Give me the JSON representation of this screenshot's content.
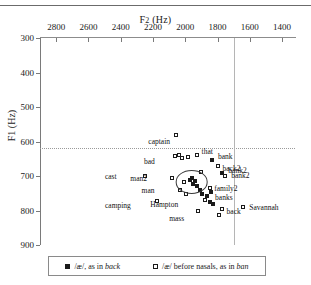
{
  "chart_data": {
    "type": "scatter",
    "title": "",
    "xlabel": "F2 (Hz)",
    "ylabel": "F1 (Hz)",
    "xlim": [
      2900,
      1320
    ],
    "ylim": [
      900,
      300
    ],
    "x_ticks": [
      2800,
      2600,
      2400,
      2200,
      2000,
      1800,
      1600,
      1400
    ],
    "y_ticks": [
      300,
      400,
      500,
      600,
      700,
      800,
      900
    ],
    "x_inverted": true,
    "y_inverted": true,
    "grid": false,
    "reference_lines": [
      {
        "orientation": "horizontal",
        "value": 620,
        "style": "dotted"
      },
      {
        "orientation": "vertical",
        "value": 1700,
        "style": "solid"
      }
    ],
    "annotations": [
      {
        "shape": "ellipse",
        "cx": 1960,
        "cy": 718,
        "rx": 95,
        "ry": 32
      }
    ],
    "series": [
      {
        "name": "/æ/, as in back",
        "marker": "filled-square",
        "points": [
          {
            "label": "bank",
            "x": 1835,
            "y": 654,
            "lx": 6,
            "ly": -4
          },
          {
            "label": "bank2",
            "x": 1770,
            "y": 690,
            "lx": 6,
            "ly": -3
          },
          {
            "label": "banks",
            "x": 1840,
            "y": 745,
            "lx": 4,
            "ly": 5
          },
          {
            "label": "",
            "x": 1958,
            "y": 706,
            "lx": 0,
            "ly": 0
          },
          {
            "label": "",
            "x": 1972,
            "y": 712,
            "lx": 0,
            "ly": 0
          },
          {
            "label": "",
            "x": 1938,
            "y": 714,
            "lx": 0,
            "ly": 0
          },
          {
            "label": "",
            "x": 1952,
            "y": 722,
            "lx": 0,
            "ly": 0
          },
          {
            "label": "",
            "x": 1925,
            "y": 728,
            "lx": 0,
            "ly": 0
          },
          {
            "label": "",
            "x": 1908,
            "y": 740,
            "lx": 0,
            "ly": 0
          },
          {
            "label": "",
            "x": 1895,
            "y": 752,
            "lx": 0,
            "ly": 0
          },
          {
            "label": "",
            "x": 1868,
            "y": 758,
            "lx": 0,
            "ly": 0
          },
          {
            "label": "Hampton",
            "x": 1845,
            "y": 775,
            "lx": -44,
            "ly": 2
          },
          {
            "label": "",
            "x": 1826,
            "y": 782,
            "lx": 0,
            "ly": 0
          }
        ]
      },
      {
        "name": "/æ/ before nasals, as in ban",
        "marker": "open-square",
        "points": [
          {
            "label": "captain",
            "x": 2055,
            "y": 582,
            "lx": -12,
            "ly": 6
          },
          {
            "label": "that",
            "x": 1930,
            "y": 638,
            "lx": 5,
            "ly": -4
          },
          {
            "label": "bad",
            "x": 2020,
            "y": 648,
            "lx": -22,
            "ly": 3
          },
          {
            "label": "",
            "x": 2065,
            "y": 641,
            "lx": 0,
            "ly": 0
          },
          {
            "label": "",
            "x": 2038,
            "y": 640,
            "lx": 0,
            "ly": 0
          },
          {
            "label": "",
            "x": 1985,
            "y": 645,
            "lx": 0,
            "ly": 0
          },
          {
            "label": "back2",
            "x": 1800,
            "y": 672,
            "lx": 5,
            "ly": 2
          },
          {
            "label": "bank2",
            "x": 1752,
            "y": 700,
            "lx": 6,
            "ly": -1
          },
          {
            "label": "cast",
            "x": 2250,
            "y": 700,
            "lx": -24,
            "ly": 0
          },
          {
            "label": "man2",
            "x": 2080,
            "y": 707,
            "lx": -26,
            "ly": 0
          },
          {
            "label": "man",
            "x": 2035,
            "y": 742,
            "lx": -22,
            "ly": 0
          },
          {
            "label": "family2",
            "x": 1845,
            "y": 735,
            "lx": 4,
            "ly": 0
          },
          {
            "label": "camping",
            "x": 2175,
            "y": 772,
            "lx": -36,
            "ly": 4
          },
          {
            "label": "back",
            "x": 1775,
            "y": 795,
            "lx": 5,
            "ly": 2
          },
          {
            "label": "Savannah",
            "x": 1640,
            "y": 790,
            "lx": 6,
            "ly": 0
          },
          {
            "label": "mass",
            "x": 1920,
            "y": 800,
            "lx": -13,
            "ly": 7
          },
          {
            "label": "",
            "x": 1790,
            "y": 812,
            "lx": 0,
            "ly": 0
          },
          {
            "label": "",
            "x": 1878,
            "y": 770,
            "lx": 0,
            "ly": 0
          },
          {
            "label": "",
            "x": 1900,
            "y": 688,
            "lx": 0,
            "ly": 0
          },
          {
            "label": "",
            "x": 2005,
            "y": 718,
            "lx": 0,
            "ly": 0
          },
          {
            "label": "",
            "x": 1995,
            "y": 752,
            "lx": 0,
            "ly": 0
          }
        ]
      }
    ]
  },
  "axes": {
    "x_title_main": "F",
    "x_title_sub": "2",
    "x_title_unit": " (Hz)",
    "y_title_main": "F",
    "y_title_sub": "1",
    "y_title_unit": " (Hz)"
  },
  "legend": {
    "items": [
      {
        "marker": "filled-square",
        "prefix": "/æ/, as in ",
        "italic": "back",
        "suffix": ""
      },
      {
        "marker": "open-square",
        "prefix": "/æ/ before nasals, as in ",
        "italic": "ban",
        "suffix": ""
      }
    ]
  }
}
